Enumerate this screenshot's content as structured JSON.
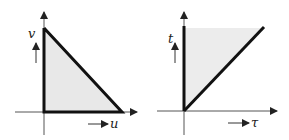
{
  "figure": {
    "panels": [
      {
        "id": "uv-plane",
        "region": "right triangle bounded by u-axis, v-axis and line u+v=const",
        "x_axis_label": "u",
        "y_axis_label": "v",
        "fill_color": "#e8e8e8",
        "edge_color": "#111111"
      },
      {
        "id": "tau-t-plane",
        "region": "triangle between t-axis and line t=tau (t >= tau)",
        "x_axis_label": "τ",
        "y_axis_label": "t",
        "fill_color": "#ececec",
        "edge_color": "#111111"
      }
    ]
  }
}
